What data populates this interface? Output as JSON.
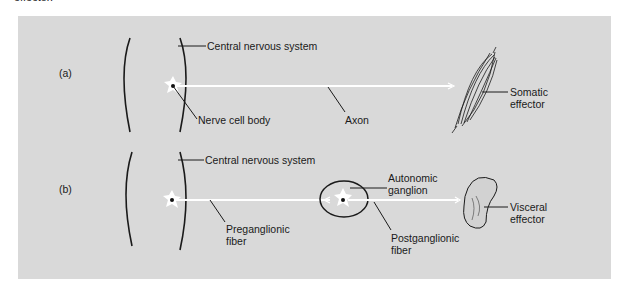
{
  "header": {
    "cut_text": "effector."
  },
  "panel_a": {
    "tag": "(a)",
    "cns_label": "Central nervous system",
    "cell_body_label": "Nerve cell body",
    "axon_label": "Axon",
    "effector_label_line1": "Somatic",
    "effector_label_line2": "effector"
  },
  "panel_b": {
    "tag": "(b)",
    "cns_label": "Central nervous system",
    "ganglion_label_line1": "Autonomic",
    "ganglion_label_line2": "ganglion",
    "pre_label_line1": "Preganglionic",
    "pre_label_line2": "fiber",
    "post_label_line1": "Postganglionic",
    "post_label_line2": "fiber",
    "effector_label_line1": "Visceral",
    "effector_label_line2": "effector"
  },
  "colors": {
    "panel_bg": "#d9d9d9",
    "fiber": "#ffffff",
    "ink": "#1a1a1a"
  }
}
